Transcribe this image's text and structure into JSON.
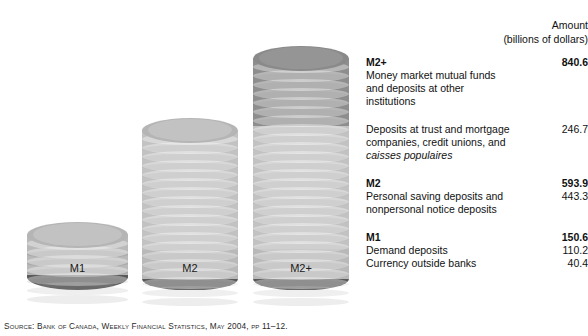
{
  "chart_data": {
    "type": "bar",
    "title": "",
    "subtitle": "",
    "xlabel": "",
    "ylabel": "Amount (billions of dollars)",
    "categories": [
      "M1",
      "M2",
      "M2+"
    ],
    "values": [
      150.6,
      593.9,
      840.6
    ],
    "ylim": [
      0,
      840.6
    ],
    "grid": false,
    "legend_position": "right",
    "stacked": true,
    "series": [
      {
        "name": "Currency outside banks",
        "values": [
          40.4,
          40.4,
          40.4
        ],
        "color": "#595959"
      },
      {
        "name": "Demand deposits",
        "values": [
          110.2,
          110.2,
          110.2
        ],
        "color": "#b9b9b9"
      },
      {
        "name": "Personal saving deposits and nonpersonal notice deposits",
        "values": [
          0,
          443.3,
          443.3
        ],
        "color": "#c2c2c2"
      },
      {
        "name": "Deposits at trust and mortgage companies, credit unions, and caisses populaires",
        "values": [
          0,
          0,
          246.7
        ],
        "color": "#8e8e8e"
      }
    ],
    "tick_labels": [
      "M1",
      "M2",
      "M2+"
    ],
    "annotations": [
      "M2+ = 840.6",
      "M2 = 593.9",
      "M1 = 150.6"
    ]
  },
  "amount_header": {
    "line1": "Amount",
    "line2": "(billions of dollars)"
  },
  "axis": {
    "categories": [
      {
        "label": "M1"
      },
      {
        "label": "M2"
      },
      {
        "label": "M2+"
      }
    ]
  },
  "legend": {
    "groups": [
      {
        "heading": "M2+",
        "heading_value": "840.6",
        "lines": [
          {
            "text": "Money market mutual funds",
            "value": ""
          },
          {
            "text": "and deposits at other",
            "value": ""
          },
          {
            "text": "institutions",
            "value": ""
          }
        ]
      },
      {
        "heading": "",
        "heading_value": "",
        "lines": [
          {
            "text": "Deposits at trust and mortgage",
            "value": "246.7"
          },
          {
            "text": "companies, credit unions, and",
            "value": ""
          },
          {
            "text": "caisses populaires",
            "value": "",
            "italic": true
          }
        ]
      },
      {
        "heading": "M2",
        "heading_value": "593.9",
        "lines": [
          {
            "text": "Personal saving deposits and",
            "value": "443.3"
          },
          {
            "text": "nonpersonal notice deposits",
            "value": ""
          }
        ]
      },
      {
        "heading": "M1",
        "heading_value": "150.6",
        "lines": [
          {
            "text": "Demand deposits",
            "value": "110.2"
          },
          {
            "text": "Currency outside banks",
            "value": "40.4"
          }
        ]
      }
    ]
  },
  "source": {
    "text": "Source: Bank of Canada, Weekly Financial Statistics, May 2004, pp 11–12."
  },
  "colors": {
    "segment_dark": "#595959",
    "segment_mid": "#8e8e8e",
    "segment_light": "#c2c2c2",
    "top_cap_light": "#b5b5b5",
    "top_cap_dark": "#8a8a8a",
    "text": "#111111",
    "background": "#ffffff"
  }
}
